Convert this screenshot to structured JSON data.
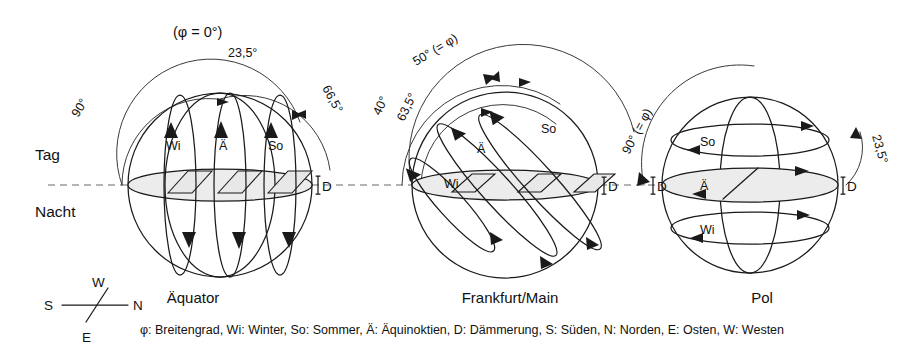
{
  "figure": {
    "type": "diagram",
    "horizon": {
      "day_label": "Tag",
      "night_label": "Nacht"
    },
    "compass": {
      "north": "N",
      "south": "S",
      "east": "E",
      "west": "W"
    },
    "panels": [
      {
        "id": "equator",
        "title": "Äquator",
        "latitude_note": "(φ = 0°)",
        "angles": [
          {
            "label": "90°",
            "position": "left-outer-arc"
          },
          {
            "label": "23,5°",
            "position": "top-right"
          },
          {
            "label": "66,5°",
            "position": "right-outer-arc"
          }
        ],
        "path_labels": [
          "Wi",
          "Ä",
          "So"
        ],
        "dusk_marks": [
          "D"
        ]
      },
      {
        "id": "frankfurt",
        "title": "Frankfurt/Main",
        "latitude_note": "50° (= φ)",
        "angles": [
          {
            "label": "40°",
            "position": "left-outer-arc"
          },
          {
            "label": "63,5°",
            "position": "left-inner-arc"
          },
          {
            "label": "50° (= φ)",
            "position": "top-arc"
          }
        ],
        "path_labels": [
          "Wi",
          "Ä",
          "So"
        ],
        "dusk_marks": [
          "D"
        ]
      },
      {
        "id": "pole",
        "title": "Pol",
        "latitude_note": "90° (= φ)",
        "angles": [
          {
            "label": "90° (= φ)",
            "position": "left-arc"
          },
          {
            "label": "23,5°",
            "position": "right-arc"
          }
        ],
        "path_labels": [
          "So",
          "Ä",
          "Wi"
        ],
        "dusk_marks": [
          "D",
          "D"
        ]
      }
    ],
    "caption": "φ: Breitengrad, Wi: Winter, So: Sommer, Ä: Äquinoktien, D: Dämmerung, S: Süden, N: Norden, E: Osten, W: Westen",
    "colors": {
      "ink": "#1a1a1a",
      "horizon_dash": "#9a9a9a",
      "shade": "#e8e8e8",
      "background": "#ffffff"
    },
    "symbols": {
      "phi": "φ",
      "degree": "°"
    }
  }
}
